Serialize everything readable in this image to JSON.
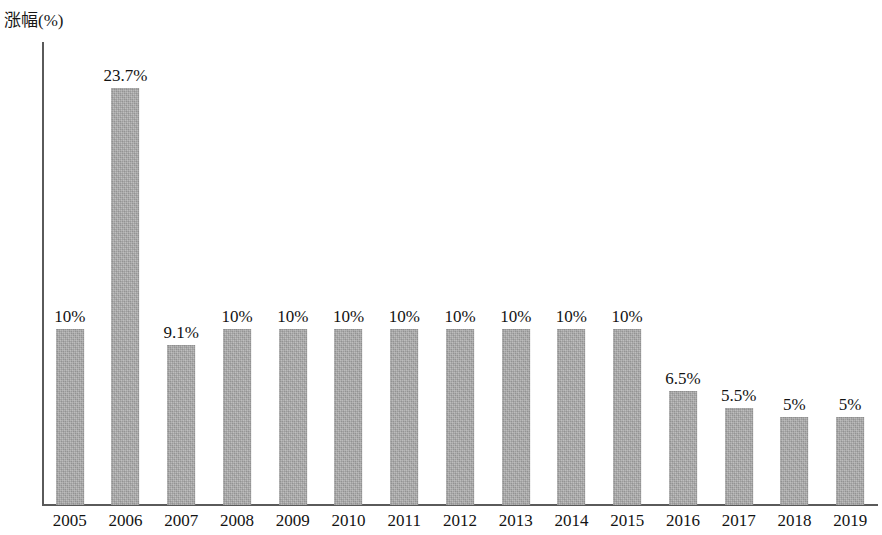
{
  "chart_data": {
    "type": "bar",
    "title": "",
    "subtitle": "",
    "xlabel": "",
    "ylabel": "涨幅(%)",
    "ylim": [
      0,
      24.5
    ],
    "grid": false,
    "legend": false,
    "bar_color": "#a9a9a9",
    "axis_color": "#5a5a5a",
    "background_color": "#ffffff",
    "categories": [
      "2005",
      "2006",
      "2007",
      "2008",
      "2009",
      "2010",
      "2011",
      "2012",
      "2013",
      "2014",
      "2015",
      "2016",
      "2017",
      "2018",
      "2019"
    ],
    "values": [
      10,
      23.7,
      9.1,
      10,
      10,
      10,
      10,
      10,
      10,
      10,
      10,
      6.5,
      5.5,
      5,
      5
    ],
    "data_labels": [
      "10%",
      "23.7%",
      "9.1%",
      "10%",
      "10%",
      "10%",
      "10%",
      "10%",
      "10%",
      "10%",
      "10%",
      "6.5%",
      "5.5%",
      "5%",
      "5%"
    ],
    "series": [
      {
        "name": "涨幅(%)",
        "values": [
          10,
          23.7,
          9.1,
          10,
          10,
          10,
          10,
          10,
          10,
          10,
          10,
          6.5,
          5.5,
          5,
          5
        ]
      }
    ]
  }
}
